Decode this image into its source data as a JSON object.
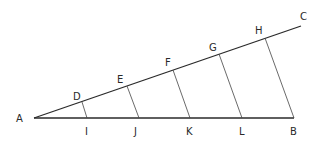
{
  "diagram": {
    "type": "geometry-construction",
    "lines": {
      "baseline": {
        "from": "A",
        "to": "B"
      },
      "ray": {
        "from": "A",
        "to": "C"
      },
      "parallels": [
        {
          "from": "D",
          "to": "I"
        },
        {
          "from": "E",
          "to": "J"
        },
        {
          "from": "F",
          "to": "K"
        },
        {
          "from": "G",
          "to": "L"
        },
        {
          "from": "H",
          "to": "B"
        }
      ]
    },
    "points": {
      "A": {
        "label": "A",
        "x": 34,
        "y": 118
      },
      "B": {
        "label": "B",
        "x": 294,
        "y": 118
      },
      "C": {
        "label": "C",
        "x": 301,
        "y": 25
      },
      "D": {
        "label": "D",
        "x": 82,
        "y": 103
      },
      "E": {
        "label": "E",
        "x": 127,
        "y": 86
      },
      "F": {
        "label": "F",
        "x": 173,
        "y": 69
      },
      "G": {
        "label": "G",
        "x": 219,
        "y": 53
      },
      "H": {
        "label": "H",
        "x": 265,
        "y": 37
      },
      "I": {
        "label": "I",
        "x": 86,
        "y": 118
      },
      "J": {
        "label": "J",
        "x": 138,
        "y": 118
      },
      "K": {
        "label": "K",
        "x": 190,
        "y": 118
      },
      "L": {
        "label": "L",
        "x": 242,
        "y": 118
      }
    },
    "colors": {
      "line": "#2a2a2a",
      "label": "#2a2a2a",
      "background": "#ffffff"
    }
  }
}
